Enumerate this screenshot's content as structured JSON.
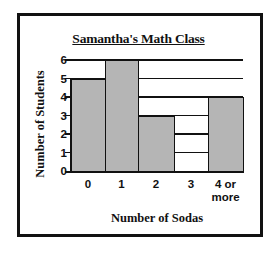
{
  "chart_data": {
    "type": "bar",
    "title": "Samantha's Math Class",
    "xlabel": "Number of Sodas",
    "ylabel": "Number of Students",
    "categories": [
      "0",
      "1",
      "2",
      "3",
      "4 or more"
    ],
    "category_display": [
      "0",
      "1",
      "2",
      "3",
      "4 or\nmore"
    ],
    "values": [
      5,
      6,
      3,
      0,
      4
    ],
    "ylim": [
      0,
      6
    ],
    "yticks": [
      "0",
      "1",
      "2",
      "3",
      "4",
      "5",
      "6"
    ],
    "grid": true,
    "legend": null,
    "bar_color": "#b5b5b5",
    "frame_color": "#111111"
  }
}
